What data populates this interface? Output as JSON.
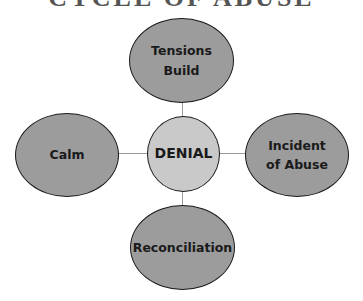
{
  "title": "CYCLE OF ABUSE",
  "colors": {
    "outer_fill": "#9c9c9c",
    "center_fill": "#c9c9c9",
    "stroke": "#1a1a1a",
    "connector": "#9a9a9a"
  },
  "center": {
    "label": "DENIAL"
  },
  "nodes": {
    "top": {
      "label": "Tensions\nBuild"
    },
    "right": {
      "label": "Incident\nof Abuse"
    },
    "bottom": {
      "label": "Reconciliation"
    },
    "left": {
      "label": "Calm"
    }
  }
}
